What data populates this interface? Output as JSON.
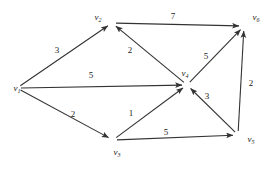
{
  "figure": {
    "kind": "weighted-directed-graph",
    "background_color": "#ffffff",
    "edge_color": "#333333",
    "label_color": "#1a1a1a",
    "width": 274,
    "height": 169
  },
  "nodes": [
    {
      "id": "v1",
      "name": "v",
      "sub": "1",
      "x": 17,
      "y": 88,
      "label_x": 17,
      "label_y": 88
    },
    {
      "id": "v2",
      "name": "v",
      "sub": "2",
      "x": 112,
      "y": 23,
      "label_x": 98,
      "label_y": 17
    },
    {
      "id": "v3",
      "name": "v",
      "sub": "3",
      "x": 113,
      "y": 140,
      "label_x": 117,
      "label_y": 152
    },
    {
      "id": "v4",
      "name": "v",
      "sub": "4",
      "x": 187,
      "y": 85,
      "label_x": 185,
      "label_y": 73
    },
    {
      "id": "v5",
      "name": "v",
      "sub": "5",
      "x": 238,
      "y": 135,
      "label_x": 251,
      "label_y": 139
    },
    {
      "id": "v6",
      "name": "v",
      "sub": "6",
      "x": 244,
      "y": 26,
      "label_x": 256,
      "label_y": 17
    }
  ],
  "edges": [
    {
      "id": "e-v1-v2",
      "from": "v1",
      "to": "v2",
      "weight": "3",
      "label_x": 57,
      "label_y": 50
    },
    {
      "id": "e-v1-v4",
      "from": "v1",
      "to": "v4",
      "weight": "5",
      "label_x": 91,
      "label_y": 75
    },
    {
      "id": "e-v1-v3",
      "from": "v1",
      "to": "v3",
      "weight": "2",
      "label_x": 73,
      "label_y": 114
    },
    {
      "id": "e-v4-v2",
      "from": "v4",
      "to": "v2",
      "weight": "2",
      "label_x": 130,
      "label_y": 50
    },
    {
      "id": "e-v2-v6",
      "from": "v2",
      "to": "v6",
      "weight": "7",
      "label_x": 173,
      "label_y": 16
    },
    {
      "id": "e-v4-v6",
      "from": "v4",
      "to": "v6",
      "weight": "5",
      "label_x": 206,
      "label_y": 56
    },
    {
      "id": "e-v3-v4",
      "from": "v3",
      "to": "v4",
      "weight": "1",
      "label_x": 131,
      "label_y": 113
    },
    {
      "id": "e-v3-v5",
      "from": "v3",
      "to": "v5",
      "weight": "5",
      "label_x": 166,
      "label_y": 132
    },
    {
      "id": "e-v5-v4",
      "from": "v5",
      "to": "v4",
      "weight": "3",
      "label_x": 207,
      "label_y": 96
    },
    {
      "id": "e-v5-v6",
      "from": "v5",
      "to": "v6",
      "weight": "2",
      "label_x": 251,
      "label_y": 83
    }
  ]
}
